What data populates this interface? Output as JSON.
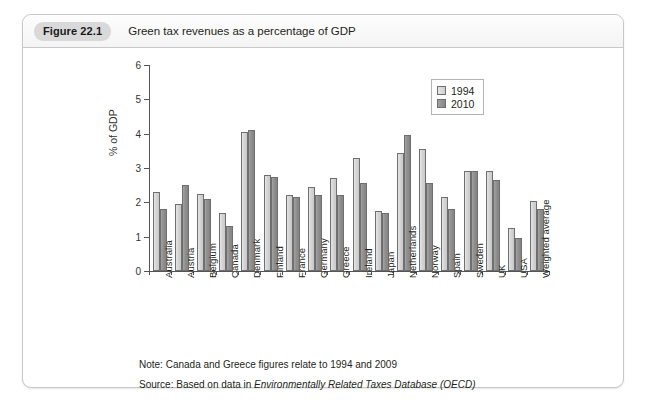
{
  "figure": {
    "number_label": "Figure 22.1",
    "caption": "Green tax revenues as a percentage of GDP"
  },
  "notes": {
    "note_prefix": "Note: Canada and Greece figures relate to 1994 and 2009",
    "source_prefix": "Source: Based on data in ",
    "source_italic": "Environmentally Related Taxes Database (OECD)"
  },
  "legend": {
    "position": "top-right-inside-plot",
    "items": [
      {
        "label": "1994",
        "color": "#d4d4d4"
      },
      {
        "label": "2010",
        "color": "#8f8f8f"
      }
    ]
  },
  "chart_data": {
    "type": "bar",
    "title": "Green tax revenues as a percentage of GDP",
    "xlabel": "",
    "ylabel": "% of GDP",
    "ylim": [
      0,
      6
    ],
    "yticks": [
      0,
      1,
      2,
      3,
      4,
      5,
      6
    ],
    "ytick_labels": [
      "0",
      "1",
      "2",
      "3",
      "4",
      "5",
      "6"
    ],
    "grid": false,
    "legend_entries": [
      "1994",
      "2010"
    ],
    "categories": [
      "Australia",
      "Austria",
      "Belgium",
      "Canada",
      "Denmark",
      "Finland",
      "France",
      "Germany",
      "Greece",
      "Ireland",
      "Japan",
      "Netherlands",
      "Norway",
      "Spain",
      "Sweden",
      "UK",
      "USA",
      "Weighted average"
    ],
    "series": [
      {
        "name": "1994",
        "values": [
          2.3,
          1.95,
          2.25,
          1.7,
          4.05,
          2.8,
          2.2,
          2.45,
          2.7,
          3.3,
          1.75,
          3.45,
          3.55,
          2.15,
          2.9,
          2.9,
          1.25,
          2.05
        ]
      },
      {
        "name": "2010",
        "values": [
          1.8,
          2.5,
          2.1,
          1.3,
          4.1,
          2.75,
          2.15,
          2.2,
          2.2,
          2.55,
          1.7,
          3.95,
          2.55,
          1.8,
          2.9,
          2.65,
          0.95,
          1.8
        ]
      }
    ],
    "annotations": [
      "Note: Canada and Greece figures relate to 1994 and 2009",
      "Source: Based on data in Environmentally Related Taxes Database (OECD)"
    ]
  }
}
